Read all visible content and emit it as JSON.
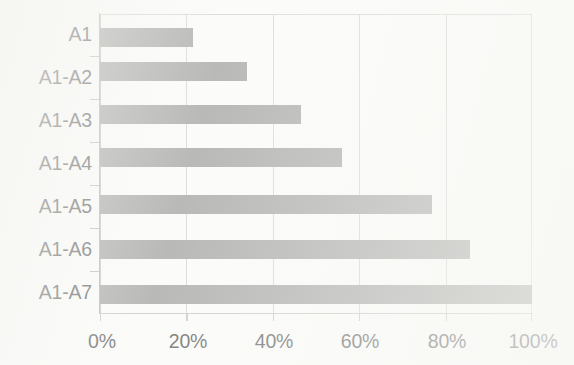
{
  "chart_data": {
    "type": "bar",
    "orientation": "horizontal",
    "title": "",
    "xlabel": "",
    "ylabel": "",
    "categories": [
      "A1",
      "A1-A2",
      "A1-A3",
      "A1-A4",
      "A1-A5",
      "A1-A6",
      "A1-A7"
    ],
    "values": [
      21.5,
      34.0,
      46.5,
      56.0,
      76.8,
      85.6,
      100.0
    ],
    "value_unit": "%",
    "xlim": [
      0,
      100
    ],
    "xticks": [
      0,
      20,
      40,
      60,
      80,
      100
    ],
    "xtick_labels": [
      "0%",
      "20%",
      "40%",
      "60%",
      "80%",
      "100%"
    ],
    "grid": "vertical",
    "legend": "none",
    "bar_color": "#8c8c8a",
    "gridline_color": "#c9c9c6",
    "axis_color": "#9d9d9a",
    "text_color": "#2c2c2c",
    "background_color": "#fbfbf9"
  },
  "axis": {
    "category_labels": [
      "A1",
      "A1-A2",
      "A1-A3",
      "A1-A4",
      "A1-A5",
      "A1-A6",
      "A1-A7"
    ],
    "value_labels": [
      "0%",
      "20%",
      "40%",
      "60%",
      "80%",
      "100%"
    ]
  }
}
